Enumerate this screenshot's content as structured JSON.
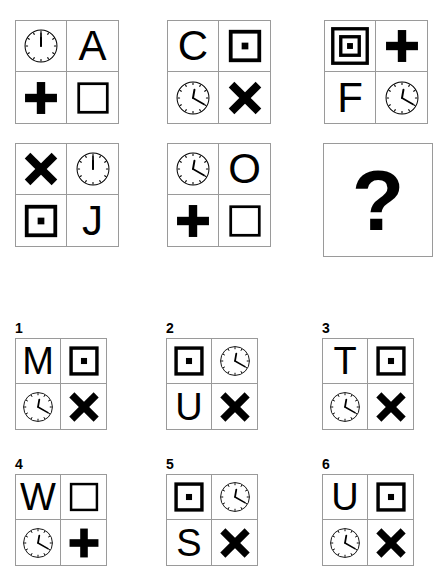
{
  "puzzle": {
    "type": "visual-analogy-matrix",
    "question_mark": "?",
    "matrix": {
      "rows": 2,
      "cols": 3,
      "panels": [
        {
          "id": "panel-1-1",
          "position": "row1-col1",
          "cells": [
            {
              "slot": "top-left",
              "icon": "clock-icon",
              "label": "clock 12:00",
              "clock_hour": 12,
              "clock_minute": 0
            },
            {
              "slot": "top-right",
              "icon": "letter-glyph",
              "label": "A"
            },
            {
              "slot": "bottom-left",
              "icon": "plus-icon",
              "label": "plus"
            },
            {
              "slot": "bottom-right",
              "icon": "square-icon",
              "label": "square"
            }
          ]
        },
        {
          "id": "panel-1-2",
          "position": "row1-col2",
          "cells": [
            {
              "slot": "top-left",
              "icon": "letter-glyph",
              "label": "C"
            },
            {
              "slot": "top-right",
              "icon": "square-dot-icon",
              "label": "square with dot"
            },
            {
              "slot": "bottom-left",
              "icon": "clock-icon",
              "label": "clock 12:20",
              "clock_hour": 12,
              "clock_minute": 20
            },
            {
              "slot": "bottom-right",
              "icon": "cross-x-icon",
              "label": "x cross"
            }
          ]
        },
        {
          "id": "panel-1-3",
          "position": "row1-col3",
          "cells": [
            {
              "slot": "top-left",
              "icon": "nested-square-dot-icon",
              "label": "nested square with dot"
            },
            {
              "slot": "top-right",
              "icon": "plus-icon",
              "label": "plus"
            },
            {
              "slot": "bottom-left",
              "icon": "letter-glyph",
              "label": "F"
            },
            {
              "slot": "bottom-right",
              "icon": "clock-icon",
              "label": "clock 12:20",
              "clock_hour": 12,
              "clock_minute": 20
            }
          ]
        },
        {
          "id": "panel-2-1",
          "position": "row2-col1",
          "cells": [
            {
              "slot": "top-left",
              "icon": "cross-x-icon",
              "label": "x cross"
            },
            {
              "slot": "top-right",
              "icon": "clock-icon",
              "label": "clock 12:00",
              "clock_hour": 12,
              "clock_minute": 0
            },
            {
              "slot": "bottom-left",
              "icon": "square-dot-icon",
              "label": "square with dot"
            },
            {
              "slot": "bottom-right",
              "icon": "letter-glyph",
              "label": "J"
            }
          ]
        },
        {
          "id": "panel-2-2",
          "position": "row2-col2",
          "cells": [
            {
              "slot": "top-left",
              "icon": "clock-icon",
              "label": "clock 12:20",
              "clock_hour": 12,
              "clock_minute": 20
            },
            {
              "slot": "top-right",
              "icon": "letter-glyph",
              "label": "O"
            },
            {
              "slot": "bottom-left",
              "icon": "plus-icon",
              "label": "plus"
            },
            {
              "slot": "bottom-right",
              "icon": "square-icon",
              "label": "square"
            }
          ]
        },
        {
          "id": "panel-2-3",
          "position": "row2-col3",
          "is_question": true,
          "cells": []
        }
      ]
    },
    "options": [
      {
        "number": "1",
        "id": "option-1",
        "cells": [
          {
            "slot": "top-left",
            "icon": "letter-glyph",
            "label": "M"
          },
          {
            "slot": "top-right",
            "icon": "square-dot-icon",
            "label": "square with dot"
          },
          {
            "slot": "bottom-left",
            "icon": "clock-icon",
            "label": "clock 12:20",
            "clock_hour": 12,
            "clock_minute": 20
          },
          {
            "slot": "bottom-right",
            "icon": "cross-x-icon",
            "label": "x cross"
          }
        ]
      },
      {
        "number": "2",
        "id": "option-2",
        "cells": [
          {
            "slot": "top-left",
            "icon": "square-dot-icon",
            "label": "square with dot"
          },
          {
            "slot": "top-right",
            "icon": "clock-icon",
            "label": "clock 12:20",
            "clock_hour": 12,
            "clock_minute": 20
          },
          {
            "slot": "bottom-left",
            "icon": "letter-glyph",
            "label": "U"
          },
          {
            "slot": "bottom-right",
            "icon": "cross-x-icon",
            "label": "x cross"
          }
        ]
      },
      {
        "number": "3",
        "id": "option-3",
        "cells": [
          {
            "slot": "top-left",
            "icon": "letter-glyph",
            "label": "T"
          },
          {
            "slot": "top-right",
            "icon": "square-dot-icon",
            "label": "square with dot"
          },
          {
            "slot": "bottom-left",
            "icon": "clock-icon",
            "label": "clock 12:20",
            "clock_hour": 12,
            "clock_minute": 20
          },
          {
            "slot": "bottom-right",
            "icon": "cross-x-icon",
            "label": "x cross"
          }
        ]
      },
      {
        "number": "4",
        "id": "option-4",
        "cells": [
          {
            "slot": "top-left",
            "icon": "letter-glyph",
            "label": "W"
          },
          {
            "slot": "top-right",
            "icon": "square-icon",
            "label": "square"
          },
          {
            "slot": "bottom-left",
            "icon": "clock-icon",
            "label": "clock 12:20",
            "clock_hour": 12,
            "clock_minute": 20
          },
          {
            "slot": "bottom-right",
            "icon": "plus-icon",
            "label": "plus"
          }
        ]
      },
      {
        "number": "5",
        "id": "option-5",
        "cells": [
          {
            "slot": "top-left",
            "icon": "square-dot-icon",
            "label": "square with dot"
          },
          {
            "slot": "top-right",
            "icon": "clock-icon",
            "label": "clock 12:20",
            "clock_hour": 12,
            "clock_minute": 20
          },
          {
            "slot": "bottom-left",
            "icon": "letter-glyph",
            "label": "S"
          },
          {
            "slot": "bottom-right",
            "icon": "cross-x-icon",
            "label": "x cross"
          }
        ]
      },
      {
        "number": "6",
        "id": "option-6",
        "cells": [
          {
            "slot": "top-left",
            "icon": "letter-glyph",
            "label": "U"
          },
          {
            "slot": "top-right",
            "icon": "square-dot-icon",
            "label": "square with dot"
          },
          {
            "slot": "bottom-left",
            "icon": "clock-icon",
            "label": "clock 12:20",
            "clock_hour": 12,
            "clock_minute": 20
          },
          {
            "slot": "bottom-right",
            "icon": "cross-x-icon",
            "label": "x cross"
          }
        ]
      }
    ]
  },
  "colors": {
    "ink": "#000000",
    "border": "#9a9a9a",
    "background": "#ffffff"
  }
}
